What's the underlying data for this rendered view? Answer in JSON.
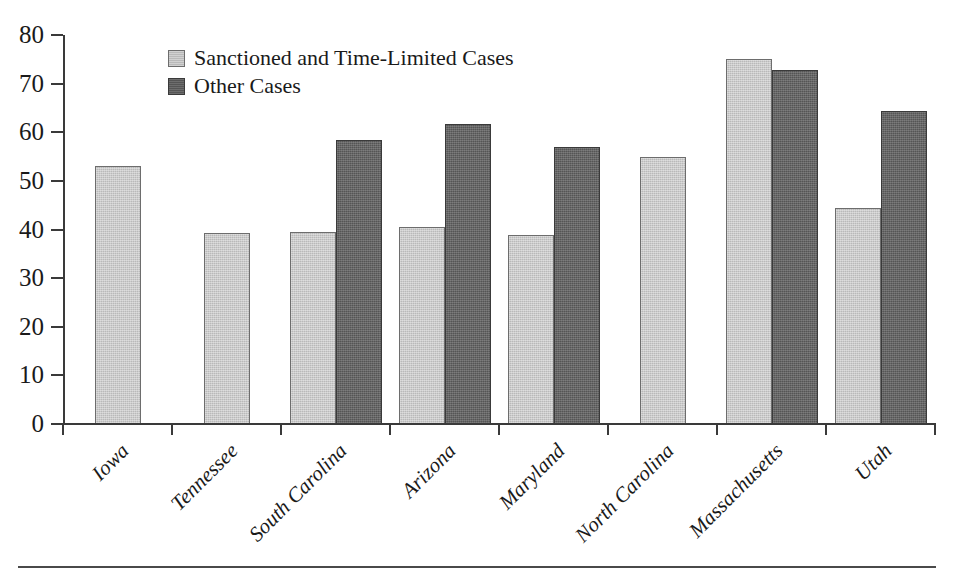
{
  "chart_data": {
    "type": "bar",
    "title": "",
    "subtitle": "",
    "xlabel": "",
    "ylabel": "",
    "ylim": [
      0,
      80
    ],
    "ytick_values": [
      80,
      70,
      60,
      50,
      40,
      30,
      20,
      10,
      0
    ],
    "ytick_labels": [
      "80",
      "70",
      "60",
      "50",
      "40",
      "30",
      "20",
      "10",
      "0"
    ],
    "grid": false,
    "legend_position": "top-left-inside",
    "categories": [
      "Iowa",
      "Tennessee",
      "South Carolina",
      "Arizona",
      "Maryland",
      "North Carolina",
      "Massachusetts",
      "Utah"
    ],
    "series": [
      {
        "name": "Sanctioned and Time-Limited Cases",
        "color": "#b9b9b9",
        "values": [
          53,
          39.3,
          39.4,
          40.6,
          38.8,
          55,
          75,
          44.5
        ]
      },
      {
        "name": "Other Cases",
        "color": "#555555",
        "values": [
          null,
          null,
          58.5,
          61.8,
          57,
          null,
          72.8,
          64.3
        ]
      }
    ]
  },
  "legend": {
    "items": [
      {
        "label": "Sanctioned and Time-Limited Cases",
        "swatch": "light-gray-swatch"
      },
      {
        "label": "Other Cases",
        "swatch": "dark-gray-swatch"
      }
    ]
  },
  "colors": {
    "light_bar": "#b9b9b9",
    "dark_bar": "#555555",
    "axis": "#3a3a3a",
    "text": "#1a1a1a",
    "background": "#ffffff"
  }
}
